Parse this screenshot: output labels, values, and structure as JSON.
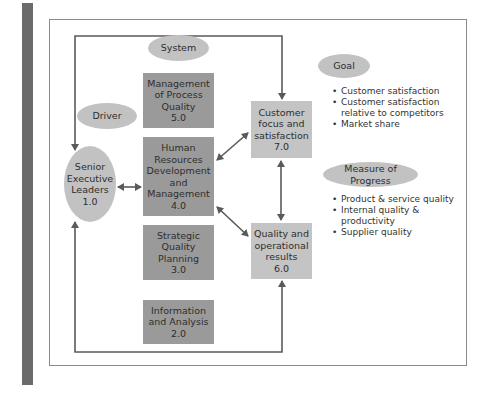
{
  "diagram": {
    "labels": {
      "system": "System",
      "driver": "Driver",
      "goal": "Goal",
      "measure": "Measure of Progress"
    },
    "nodes": {
      "senior": "Senior\nExecutive\nLeaders\n1.0",
      "process": "Management\nof Process\nQuality\n5.0",
      "hr": "Human\nResources\nDevelopment\nand\nManagement\n4.0",
      "strategic": "Strategic\nQuality\nPlanning\n3.0",
      "info": "Information\nand Analysis\n2.0",
      "customer": "Customer\nfocus and\nsatisfaction\n7.0",
      "quality": "Quality and\noperational\nresults\n6.0"
    },
    "goal_items": [
      "Customer satisfaction",
      "Customer satisfaction relative to competitors",
      "Market share"
    ],
    "measure_items": [
      "Product & service quality",
      "Internal quality & productivity",
      "Supplier quality"
    ],
    "colors": {
      "dark_box": "#9a9a9a",
      "light_box": "#c4c4c4",
      "ellipse": "#c2c2c2",
      "arrow": "#5a5a5a",
      "side_bar": "#6b6b6b"
    }
  }
}
